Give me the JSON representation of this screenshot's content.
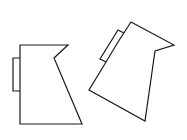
{
  "figure": {
    "background": "#ffffff",
    "stroke_color": "#1a1a1a",
    "shapes": [
      {
        "id": "left-shape",
        "body_points": "20,45 68,45 54,58 82,124 20,124",
        "tab_points": "20,58 13,58 13,91 20,91"
      },
      {
        "id": "right-shape",
        "body_points": "131,22 174,45 155,51 145,121 89,90 106,62 118,42",
        "tab_points": "124,33 118,30 100,59 106,62"
      }
    ]
  }
}
